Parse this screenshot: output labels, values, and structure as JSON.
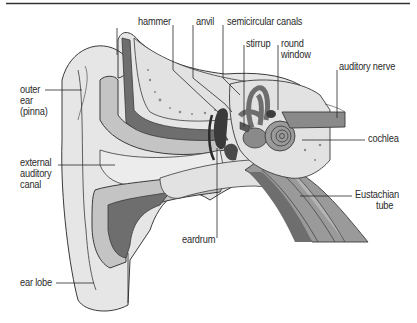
{
  "diagram": {
    "type": "anatomical-illustration",
    "labels": {
      "hammer": "hammer",
      "anvil": "anvil",
      "semicircular_canals": "semicircular canals",
      "stirrup": "stirrup",
      "round_window_1": "round",
      "round_window_2": "window",
      "auditory_nerve": "auditory nerve",
      "outer_ear_1": "outer",
      "outer_ear_2": "ear",
      "outer_ear_3": "(pinna)",
      "external_canal_1": "external",
      "external_canal_2": "auditory",
      "external_canal_3": "canal",
      "cochlea": "cochlea",
      "eustachian_1": "Eustachian",
      "eustachian_2": "tube",
      "eardrum": "eardrum",
      "ear_lobe": "ear lobe"
    },
    "colors": {
      "skin": "#e6e6e6",
      "cartilage": "#c4c4c4",
      "bone": "#e2e2e2",
      "dark_tissue": "#6e6e6e",
      "mid_tissue": "#9a9a9a",
      "outline": "#3a3a3a",
      "text": "#2a2a2a"
    }
  }
}
